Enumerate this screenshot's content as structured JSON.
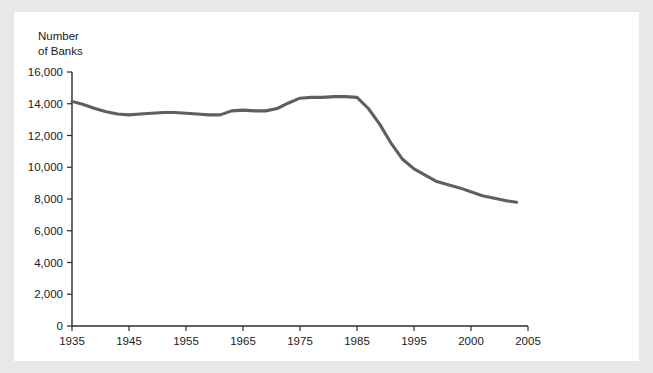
{
  "figure": {
    "background_color": "#e8e8e8",
    "panel_color": "#ffffff"
  },
  "chart_data": {
    "type": "line",
    "title": "",
    "subtitle": "",
    "xlabel": "",
    "ylabel": "Number\nof Banks",
    "ylabel_line1": "Number",
    "ylabel_line2": "of Banks",
    "series_color": "#5f5f5f",
    "grid": false,
    "legend_position": "none",
    "xlim": [
      1935,
      2005
    ],
    "ylim": [
      0,
      16000
    ],
    "ytick_labels": [
      "0",
      "2,000",
      "4,000",
      "6,000",
      "8,000",
      "10,000",
      "12,000",
      "14,000",
      "16,000"
    ],
    "ytick_values": [
      0,
      2000,
      4000,
      6000,
      8000,
      10000,
      12000,
      14000,
      16000
    ],
    "xtick_labels": [
      "1935",
      "1945",
      "1955",
      "1965",
      "1975",
      "1985",
      "1995",
      "2000",
      "2005"
    ],
    "xtick_values": [
      1935,
      1945,
      1955,
      1965,
      1975,
      1985,
      1995,
      2000,
      2005
    ],
    "series": [
      {
        "name": "Number of Banks",
        "x": [
          1935,
          1937,
          1939,
          1941,
          1943,
          1945,
          1947,
          1949,
          1951,
          1953,
          1955,
          1957,
          1959,
          1961,
          1963,
          1965,
          1967,
          1969,
          1971,
          1973,
          1975,
          1977,
          1979,
          1981,
          1983,
          1985,
          1987,
          1989,
          1991,
          1993,
          1995,
          1997,
          1999,
          2001,
          2003,
          2004
        ],
        "values": [
          14150,
          13950,
          13700,
          13500,
          13350,
          13300,
          13350,
          13400,
          13450,
          13450,
          13400,
          13350,
          13300,
          13300,
          13550,
          13600,
          13550,
          13550,
          13700,
          14050,
          14350,
          14400,
          14400,
          14450,
          14450,
          14400,
          13700,
          12700,
          11500,
          10500,
          9900,
          9100,
          8700,
          8200,
          7900,
          7800
        ]
      }
    ]
  },
  "axis": {
    "tick_color": "#2b2b2b",
    "line_color": "#2b2b2b"
  }
}
